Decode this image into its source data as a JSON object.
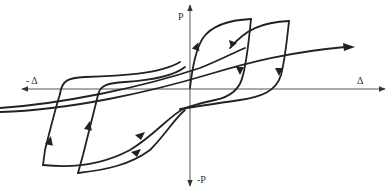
{
  "diagram": {
    "type": "hysteresis-loop",
    "axes": {
      "x_positive_label": "Δ",
      "x_negative_label": "- Δ",
      "y_positive_label": "P",
      "y_negative_label": "-P"
    },
    "colors": {
      "axis": "#555555",
      "curve": "#222222",
      "background": "#ffffff"
    }
  }
}
